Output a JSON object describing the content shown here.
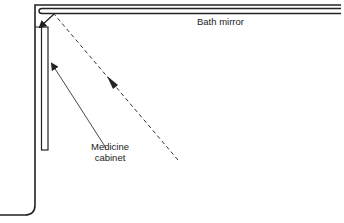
{
  "diagram": {
    "labels": {
      "bath_mirror": "Bath mirror",
      "medicine_cabinet_line1": "Medicine",
      "medicine_cabinet_line2": "cabinet"
    },
    "elements": [
      {
        "id": "wall",
        "type": "outline",
        "description": "Bathroom wall corner"
      },
      {
        "id": "bath-mirror",
        "type": "double-line",
        "description": "Bath mirror along top wall"
      },
      {
        "id": "medicine-cabinet",
        "type": "rectangle",
        "description": "Medicine cabinet on side wall"
      },
      {
        "id": "light-ray",
        "type": "dashed-arrow",
        "description": "Reflected line of sight from viewer to bath mirror, reflected onto cabinet"
      },
      {
        "id": "cabinet-leader",
        "type": "arrow",
        "description": "Leader pointing to medicine cabinet"
      }
    ],
    "colors": {
      "line": "#222222",
      "background": "#ffffff"
    }
  }
}
